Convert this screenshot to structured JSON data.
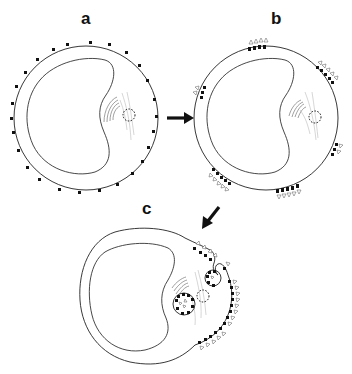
{
  "figure": {
    "panels": [
      {
        "id": "a",
        "label": "a",
        "description": "Cell with receptors uniformly distributed on surface"
      },
      {
        "id": "b",
        "label": "b",
        "description": "Ligand-bound receptors aggregated into patches"
      },
      {
        "id": "c",
        "label": "c",
        "description": "Patches coalesced into cap at one pole with endocytic vesicles"
      }
    ],
    "arrows": [
      {
        "from": "a",
        "to": "b",
        "direction": "right"
      },
      {
        "from": "b",
        "to": "c",
        "direction": "down-left"
      }
    ],
    "colors": {
      "background": "#ffffff",
      "line": "#222222",
      "receptor": "#111111",
      "golgi": "#777777",
      "spindle": "#bbbbbb"
    }
  }
}
